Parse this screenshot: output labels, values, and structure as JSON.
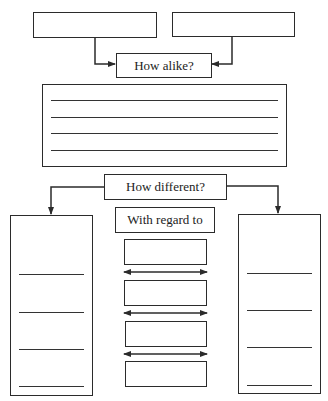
{
  "diagram": {
    "type": "compare-contrast graphic organizer",
    "top_inputs": [
      {
        "id": "item-a",
        "text": ""
      },
      {
        "id": "item-b",
        "text": ""
      }
    ],
    "alike": {
      "label": "How alike?",
      "answer_lines": 4
    },
    "different": {
      "label": "How different?",
      "regard_label": "With regard to",
      "left_column_lines": 4,
      "right_column_lines": 4,
      "criteria_boxes": 4,
      "double_arrows": 3
    },
    "colors": {
      "stroke": "#2b2b2b",
      "text": "#222222",
      "background": "#ffffff"
    }
  }
}
